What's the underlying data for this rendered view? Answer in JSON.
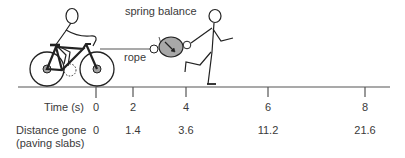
{
  "diagram": {
    "labels": {
      "spring_balance": "spring balance",
      "rope": "rope"
    },
    "rows": {
      "time_label": "Time (s)",
      "distance_label_line1": "Distance gone",
      "distance_label_line2": "(paving slabs)"
    },
    "ticks": [
      {
        "time": "0",
        "distance": "0"
      },
      {
        "time": "2",
        "distance": "1.4"
      },
      {
        "time": "4",
        "distance": "3.6"
      },
      {
        "time": "6",
        "distance": "11.2"
      },
      {
        "time": "8",
        "distance": "21.6"
      }
    ],
    "colors": {
      "line": "#333333",
      "balance_fill": "#a8a8a8",
      "hub_fill": "#a0a0a0"
    }
  }
}
